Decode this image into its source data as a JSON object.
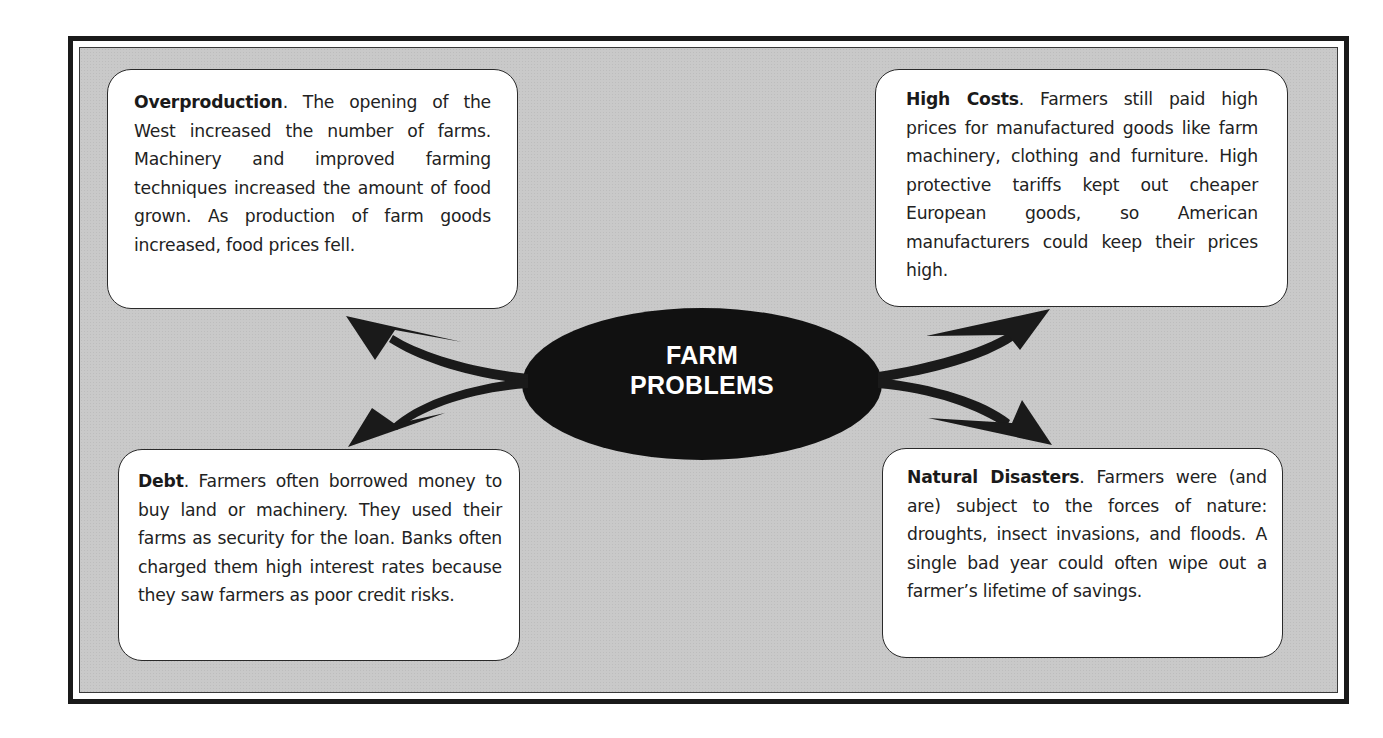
{
  "diagram": {
    "type": "concept-map",
    "hub": {
      "line1": "FARM",
      "line2": "PROBLEMS",
      "fill_color": "#111111",
      "text_color": "#ffffff"
    },
    "nodes": [
      {
        "position": "top-left",
        "title": "Overproduction",
        "body": ". The opening of the West increased the number of farms. Machinery and improved farming techniques increased the amount of food grown. As production of farm goods increased, food prices fell."
      },
      {
        "position": "top-right",
        "title": "High Costs",
        "body": ". Farmers still paid high prices for manufactured goods like farm machinery, clothing and furniture. High protective tariffs kept out cheaper European goods, so American manufacturers could keep their prices high."
      },
      {
        "position": "bottom-left",
        "title": "Debt",
        "body": ". Farmers often borrowed money to buy land or machinery. They used their farms as security for the loan. Banks often charged them high interest rates because they saw farmers as poor credit risks."
      },
      {
        "position": "bottom-right",
        "title": "Natural Disasters",
        "body": ". Farmers were (and are) subject to the forces of nature: droughts, insect invasions, and floods. A single bad year could often wipe out a farmer’s lifetime of savings."
      }
    ],
    "colors": {
      "background": "#c9c9c9",
      "frame_border": "#1a1a1a",
      "box_fill": "#ffffff",
      "arrow": "#1a1a1a"
    }
  }
}
